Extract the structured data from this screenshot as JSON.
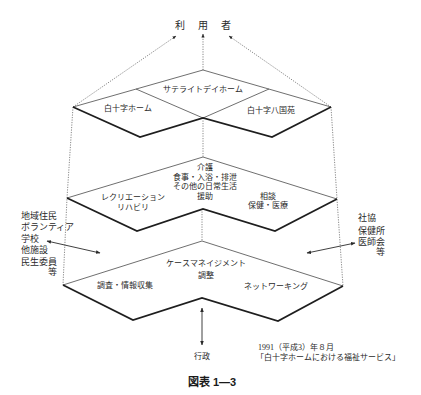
{
  "diagram": {
    "users_label": "利用者",
    "tier1": {
      "satellite": "サテライトデイホーム",
      "left": "白十字ホーム",
      "right": "白十字八国苑"
    },
    "tier2": {
      "center_lines": [
        "介護",
        "食事・入浴・排泄",
        "その他の日常生活",
        "援助"
      ],
      "left_lines": [
        "レクリエーション",
        "リハビリ"
      ],
      "right_lines": [
        "相談",
        "保健・医療"
      ]
    },
    "tier3": {
      "top_lines": [
        "ケースマネイジメント",
        "調整"
      ],
      "left": "調査・情報収集",
      "right": "ネットワーキング"
    },
    "left_group": [
      "地域住民",
      "ボランティア",
      "学校",
      "他施設",
      "民生委員",
      "等"
    ],
    "right_group": [
      "社協",
      "保健所",
      "医師会",
      "等"
    ],
    "bottom_label": "行政",
    "source": [
      "1991（平成3）年８月",
      "「白十字ホームにおける福祉サービス」"
    ]
  },
  "caption": "図表 1—3",
  "colors": {
    "line": "#1e1e1e",
    "text": "#2a2a2a",
    "background": "#ffffff"
  }
}
